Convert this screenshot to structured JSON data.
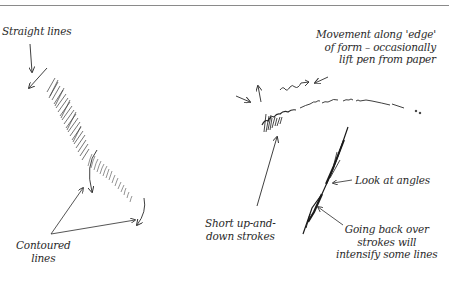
{
  "diagram": {
    "title_rule": true,
    "annotations": [
      {
        "id": "straight-lines",
        "lines": [
          "Straight lines"
        ]
      },
      {
        "id": "contoured-lines",
        "lines": [
          "Contoured",
          "lines"
        ]
      },
      {
        "id": "movement-edge",
        "lines": [
          "Movement along 'edge'",
          "of form – occasionally",
          "lift pen from paper"
        ]
      },
      {
        "id": "short-strokes",
        "lines": [
          "Short up-and-",
          "down strokes"
        ]
      },
      {
        "id": "look-angles",
        "lines": [
          "Look at angles"
        ]
      },
      {
        "id": "going-back",
        "lines": [
          "Going back over",
          "strokes will",
          "intensify some lines"
        ]
      }
    ],
    "colors": {
      "ink": "#2a2a2a",
      "rule": "#8a8a8a",
      "background": "#ffffff"
    }
  }
}
